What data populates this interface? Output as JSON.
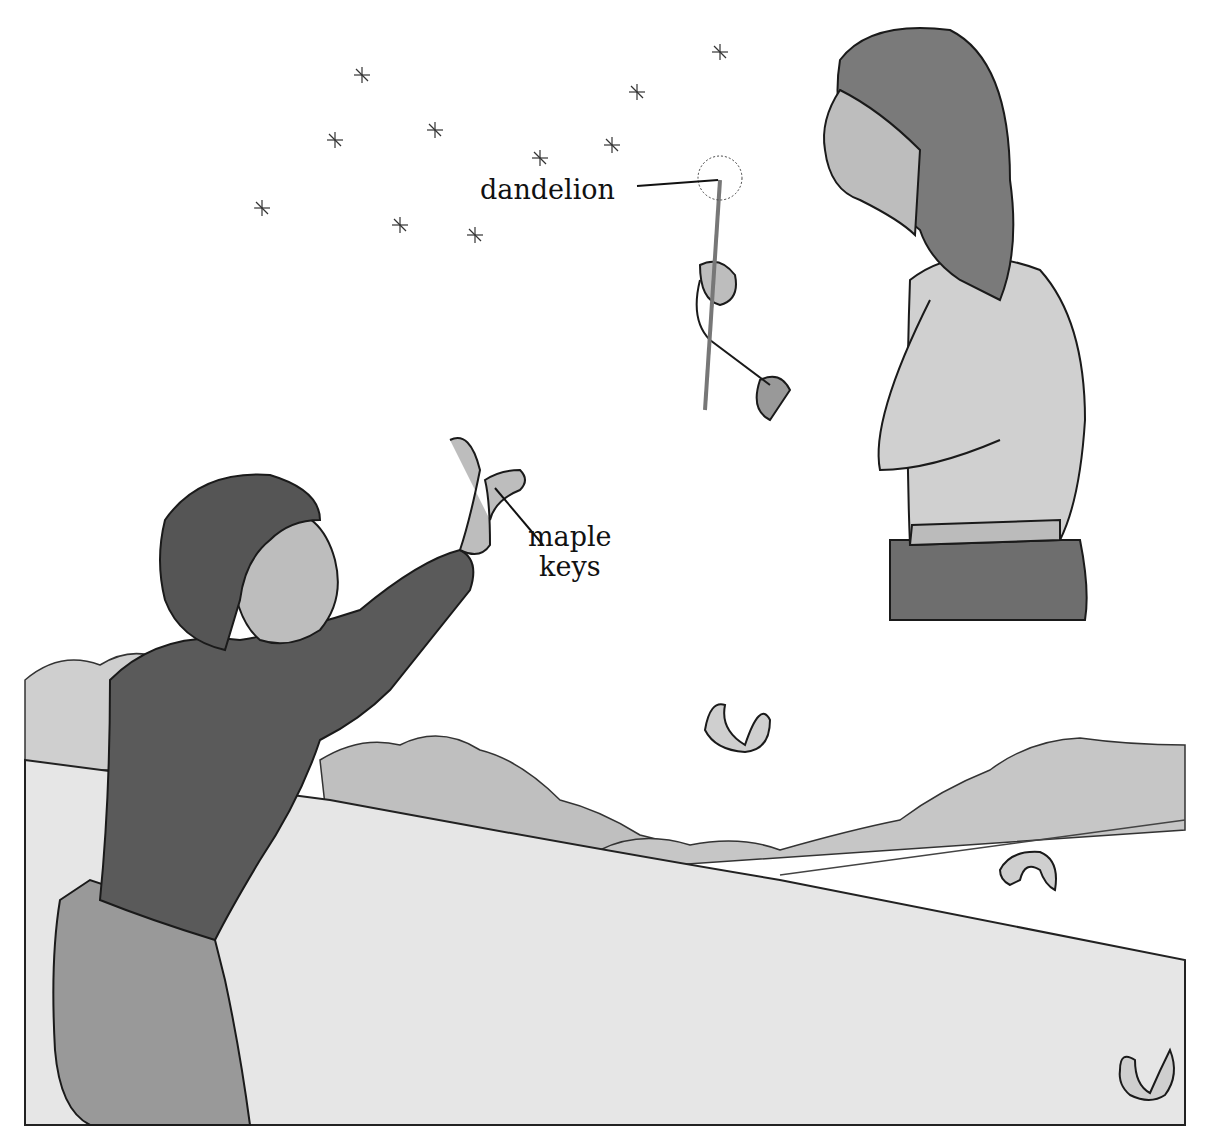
{
  "illustration": {
    "labels": {
      "dandelion": "dandelion",
      "maple_line1": "maple",
      "maple_line2": "keys"
    },
    "colors": {
      "sky": "#ffffff",
      "ink": "#1a1a1a",
      "field": "#e4e4e4",
      "trees": "#c8c8c8",
      "boy_sweater": "#5a5a5a",
      "girl_sweater": "#cfcfcf",
      "girl_skirt": "#6e6e6e",
      "hair_boy": "#555555",
      "hair_girl": "#7a7a7a",
      "skin": "#bdbdbd"
    }
  }
}
